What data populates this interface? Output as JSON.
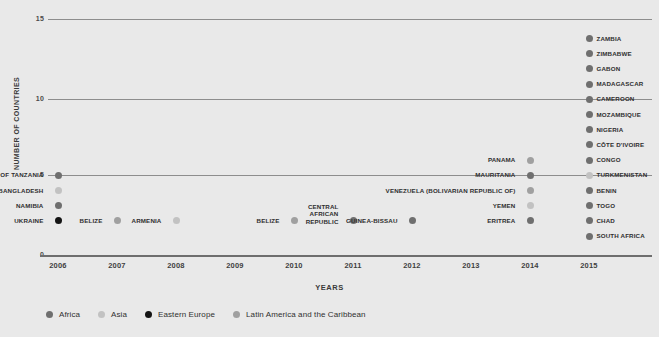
{
  "chart_data": {
    "type": "scatter",
    "title": "",
    "xlabel": "YEARS",
    "ylabel": "NUMBER OF COUNTRIES",
    "xlim": [
      2006,
      2015
    ],
    "ylim": [
      0,
      15
    ],
    "yticks": [
      "0",
      "5",
      "10",
      "15"
    ],
    "xticks": [
      "2006",
      "2007",
      "2008",
      "2009",
      "2010",
      "2011",
      "2012",
      "2013",
      "2014",
      "2015"
    ],
    "grid": true,
    "legend_position": "bottom-left",
    "legend": [
      {
        "name": "Africa",
        "color": "#6f6f6f"
      },
      {
        "name": "Asia",
        "color": "#c2c2c2"
      },
      {
        "name": "Eastern Europe",
        "color": "#141414"
      },
      {
        "name": "Latin America and the Caribbean",
        "color": "#a0a0a0"
      }
    ],
    "series": [
      {
        "name": "Africa",
        "color": "#6f6f6f",
        "points": [
          {
            "x": 2006,
            "y": 4,
            "label": "UNITED REPUBLIC OF TANZANIA"
          },
          {
            "x": 2006,
            "y": 2,
            "label": "NAMIBIA"
          },
          {
            "x": 2011,
            "y": 1,
            "label": "CENTRAL AFRICAN REPUBLIC"
          },
          {
            "x": 2012,
            "y": 1,
            "label": "GUINEA-BISSAU"
          },
          {
            "x": 2014,
            "y": 4,
            "label": "MAURITANIA"
          },
          {
            "x": 2014,
            "y": 1,
            "label": "ERITREA"
          },
          {
            "x": 2015,
            "y": 13,
            "label": "ZAMBIA"
          },
          {
            "x": 2015,
            "y": 12,
            "label": "ZIMBABWE"
          },
          {
            "x": 2015,
            "y": 11,
            "label": "GABON"
          },
          {
            "x": 2015,
            "y": 10,
            "label": "MADAGASCAR"
          },
          {
            "x": 2015,
            "y": 9,
            "label": "CAMEROON"
          },
          {
            "x": 2015,
            "y": 8,
            "label": "MOZAMBIQUE"
          },
          {
            "x": 2015,
            "y": 7,
            "label": "NIGERIA"
          },
          {
            "x": 2015,
            "y": 6,
            "label": "CÔTE D'IVOIRE"
          },
          {
            "x": 2015,
            "y": 5,
            "label": "CONGO"
          },
          {
            "x": 2015,
            "y": 3,
            "label": "BENIN"
          },
          {
            "x": 2015,
            "y": 2,
            "label": "TOGO"
          },
          {
            "x": 2015,
            "y": 1,
            "label": "CHAD"
          },
          {
            "x": 2015,
            "y": 0,
            "label": "SOUTH AFRICA"
          }
        ]
      },
      {
        "name": "Asia",
        "color": "#c2c2c2",
        "points": [
          {
            "x": 2006,
            "y": 3,
            "label": "BANGLADESH"
          },
          {
            "x": 2008,
            "y": 1,
            "label": "ARMENIA"
          },
          {
            "x": 2014,
            "y": 2,
            "label": "YEMEN"
          },
          {
            "x": 2015,
            "y": 4,
            "label": "TURKMENISTAN"
          }
        ]
      },
      {
        "name": "Eastern Europe",
        "color": "#141414",
        "points": [
          {
            "x": 2006,
            "y": 1,
            "label": "UKRAINE"
          }
        ]
      },
      {
        "name": "Latin America and the Caribbean",
        "color": "#a0a0a0",
        "points": [
          {
            "x": 2007,
            "y": 1,
            "label": "BELIZE"
          },
          {
            "x": 2010,
            "y": 1,
            "label": "BELIZE"
          },
          {
            "x": 2014,
            "y": 5,
            "label": "PANAMA"
          },
          {
            "x": 2014,
            "y": 3,
            "label": "VENEZUELA (BOLIVARIAN REPUBLIC OF)"
          }
        ]
      }
    ]
  }
}
